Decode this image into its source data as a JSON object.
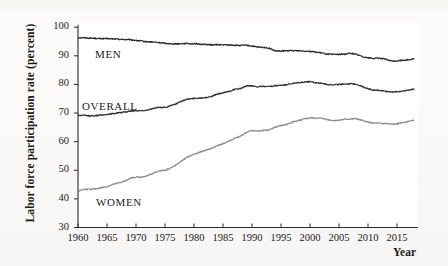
{
  "figure": {
    "background_color": "#fbfaf8",
    "plot_background_color": "#ffffff",
    "axis_color": "#2b2b2b"
  },
  "axis_titles": {
    "y": "Labor force participation rate (percent)",
    "x": "Year"
  },
  "series_labels": {
    "men": "MEN",
    "overall": "OVERALL",
    "women": "WOMEN"
  },
  "y_ticks": [
    "30",
    "40",
    "50",
    "60",
    "70",
    "80",
    "90",
    "100"
  ],
  "x_ticks": [
    "1960",
    "1965",
    "1970",
    "1975",
    "1980",
    "1985",
    "1990",
    "1995",
    "2000",
    "2005",
    "2010",
    "2015"
  ],
  "chart_data": {
    "type": "line",
    "title": "",
    "xlabel": "Year",
    "ylabel": "Labor force participation rate (percent)",
    "xlim": [
      1960,
      2018
    ],
    "ylim": [
      30,
      100
    ],
    "grid": false,
    "legend": "inline-annotations",
    "x": [
      1960,
      1961,
      1962,
      1963,
      1964,
      1965,
      1966,
      1967,
      1968,
      1969,
      1970,
      1971,
      1972,
      1973,
      1974,
      1975,
      1976,
      1977,
      1978,
      1979,
      1980,
      1981,
      1982,
      1983,
      1984,
      1985,
      1986,
      1987,
      1988,
      1989,
      1990,
      1991,
      1992,
      1993,
      1994,
      1995,
      1996,
      1997,
      1998,
      1999,
      2000,
      2001,
      2002,
      2003,
      2004,
      2005,
      2006,
      2007,
      2008,
      2009,
      2010,
      2011,
      2012,
      2013,
      2014,
      2015,
      2016,
      2017,
      2018
    ],
    "series": [
      {
        "name": "MEN",
        "color": "#262626",
        "values": [
          96.4,
          96.3,
          96.2,
          96.1,
          96.0,
          96.0,
          95.9,
          95.8,
          95.7,
          95.6,
          95.4,
          95.1,
          94.9,
          94.8,
          94.6,
          94.4,
          94.2,
          94.2,
          94.3,
          94.3,
          94.2,
          94.1,
          94.0,
          93.8,
          93.9,
          93.8,
          93.8,
          93.7,
          93.6,
          93.7,
          93.4,
          93.0,
          93.0,
          92.6,
          91.7,
          91.6,
          91.8,
          91.8,
          91.8,
          91.7,
          91.6,
          91.3,
          91.0,
          90.6,
          90.5,
          90.5,
          90.6,
          90.9,
          90.5,
          89.8,
          89.3,
          89.1,
          89.2,
          88.8,
          88.2,
          88.2,
          88.5,
          88.6,
          89.0
        ]
      },
      {
        "name": "OVERALL",
        "color": "#2e2e2e",
        "values": [
          69.2,
          69.2,
          69.0,
          69.1,
          69.3,
          69.5,
          69.8,
          70.1,
          70.3,
          70.7,
          70.9,
          70.8,
          71.1,
          71.6,
          72.0,
          72.0,
          72.6,
          73.3,
          74.3,
          74.9,
          75.1,
          75.3,
          75.4,
          75.8,
          76.6,
          77.0,
          77.6,
          78.2,
          78.6,
          79.4,
          79.5,
          79.2,
          79.3,
          79.2,
          79.5,
          79.7,
          79.9,
          80.3,
          80.6,
          80.8,
          81.0,
          80.6,
          80.4,
          80.0,
          79.9,
          80.0,
          80.2,
          80.2,
          80.1,
          79.3,
          78.5,
          78.0,
          77.9,
          77.6,
          77.4,
          77.4,
          77.7,
          78.0,
          78.4
        ]
      },
      {
        "name": "WOMEN",
        "color": "#8a8a8a",
        "values": [
          42.6,
          43.4,
          43.3,
          43.5,
          43.9,
          44.3,
          45.0,
          45.6,
          46.1,
          47.2,
          47.6,
          47.6,
          48.1,
          49.0,
          49.8,
          50.0,
          50.8,
          51.9,
          53.5,
          54.7,
          55.6,
          56.3,
          57.0,
          57.6,
          58.6,
          59.3,
          60.2,
          61.1,
          61.9,
          63.2,
          63.9,
          63.7,
          64.0,
          64.0,
          65.1,
          65.6,
          66.0,
          66.9,
          67.3,
          67.9,
          68.3,
          68.2,
          68.2,
          67.7,
          67.4,
          67.5,
          67.8,
          67.9,
          68.0,
          67.4,
          66.8,
          66.5,
          66.4,
          66.3,
          66.1,
          66.2,
          66.7,
          67.1,
          67.5
        ]
      }
    ]
  }
}
